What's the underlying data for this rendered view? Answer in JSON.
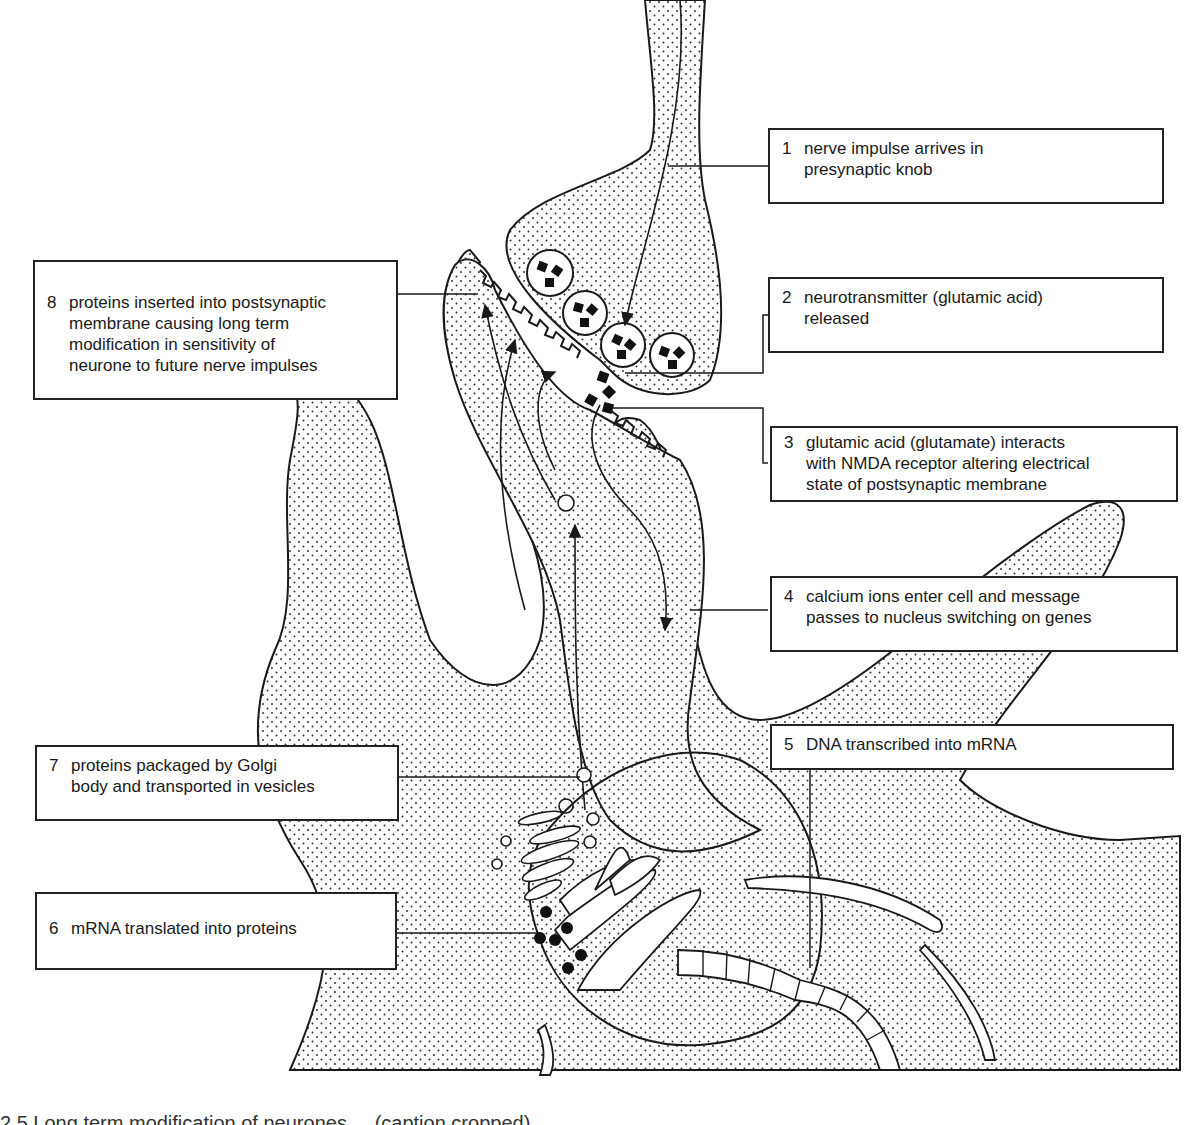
{
  "diagram": {
    "structures": [
      "presynaptic-knob",
      "synaptic-vesicles",
      "neurotransmitter-glutamic-acid",
      "postsynaptic-membrane",
      "nmda-receptors",
      "postsynaptic-dendrite",
      "cell-body",
      "nucleus",
      "dna-mrna-strand",
      "rough-endoplasmic-reticulum",
      "ribosomes",
      "golgi-body",
      "transport-vesicles"
    ],
    "labels": [
      {
        "num": "1",
        "text": "nerve impulse arrives in\npresynaptic knob"
      },
      {
        "num": "2",
        "text": "neurotransmitter (glutamic acid)\nreleased"
      },
      {
        "num": "3",
        "text": "glutamic acid (glutamate) interacts\nwith NMDA receptor altering electrical\nstate of postsynaptic membrane"
      },
      {
        "num": "4",
        "text": "calcium ions enter cell and message\npasses to nucleus switching on genes"
      },
      {
        "num": "5",
        "text": "DNA transcribed into mRNA"
      },
      {
        "num": "6",
        "text": "mRNA translated into proteins"
      },
      {
        "num": "7",
        "text": "proteins packaged by Golgi\nbody and transported in vesicles"
      },
      {
        "num": "8",
        "text": "proteins inserted into postsynaptic\nmembrane causing long term\nmodification in sensitivity of\nneurone to future nerve impulses"
      }
    ],
    "caption_partial": "2.5 Long term modification of neurones ... (caption cropped)"
  },
  "colors": {
    "ink": "#1a1a1a",
    "stipple": "#2a2a2a",
    "background": "#ffffff"
  }
}
